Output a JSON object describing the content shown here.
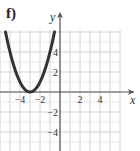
{
  "panel": {
    "label": "f)"
  },
  "chart_data": {
    "type": "line",
    "title": "",
    "function": "y = (x + 3)^2",
    "xlabel": "x",
    "ylabel": "y",
    "xlim": [
      -6,
      6
    ],
    "ylim": [
      -6,
      6
    ],
    "grid": true,
    "x_ticks": [
      {
        "value": -4,
        "label": "−4"
      },
      {
        "value": -2,
        "label": "−2"
      },
      {
        "value": 2,
        "label": "2"
      },
      {
        "value": 4,
        "label": "4"
      }
    ],
    "y_ticks": [
      {
        "value": 4,
        "label": "4"
      },
      {
        "value": 2,
        "label": "2"
      },
      {
        "value": -2,
        "label": "−2"
      },
      {
        "value": -4,
        "label": "−4"
      }
    ],
    "series": [
      {
        "name": "parabola",
        "color": "#333333",
        "x": [
          -5.45,
          -5,
          -4.5,
          -4,
          -3.5,
          -3,
          -2.5,
          -2,
          -1.5,
          -1,
          -0.55
        ],
        "y": [
          6.0,
          4.0,
          2.25,
          1.0,
          0.25,
          0.0,
          0.25,
          1.0,
          2.25,
          4.0,
          6.0
        ]
      }
    ],
    "vertex": [
      -3,
      0
    ]
  },
  "colors": {
    "grid": "#d4d4d4",
    "axis": "#555555",
    "curve": "#333333",
    "text": "#333333"
  }
}
